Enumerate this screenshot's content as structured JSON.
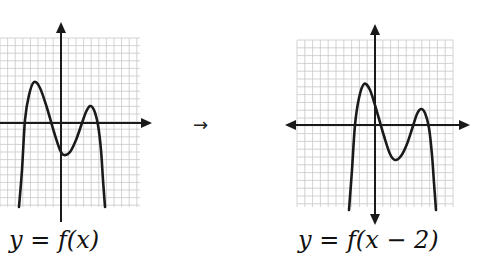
{
  "transform_arrow": "→",
  "graphs": [
    {
      "id": "original",
      "label": "y = f(x)",
      "grid": {
        "x0": 0,
        "x1": 140,
        "y0": 38,
        "y1": 207,
        "cell": 7.6,
        "color": "#c8c8c8"
      },
      "axes": {
        "origin_x": 61,
        "origin_y": 123,
        "x_arrow_end": 152,
        "x_left_end": 0,
        "y_top_end": 22,
        "y_bottom_end": 222,
        "left_arrow": false,
        "bottom_arrow": false
      },
      "curve": [
        [
          19,
          207
        ],
        [
          22,
          170
        ],
        [
          25,
          120
        ],
        [
          29,
          95
        ],
        [
          34,
          82
        ],
        [
          40,
          88
        ],
        [
          47,
          108
        ],
        [
          54,
          132
        ],
        [
          60,
          150
        ],
        [
          64,
          155
        ],
        [
          70,
          152
        ],
        [
          76,
          140
        ],
        [
          82,
          123
        ],
        [
          86,
          112
        ],
        [
          90,
          106
        ],
        [
          94,
          110
        ],
        [
          98,
          125
        ],
        [
          101,
          150
        ],
        [
          103,
          180
        ],
        [
          105,
          207
        ]
      ]
    },
    {
      "id": "shifted",
      "label": "y = f(x − 2)",
      "grid": {
        "x0": 297,
        "x1": 453,
        "y0": 40,
        "y1": 207,
        "cell": 7.8,
        "color": "#c8c8c8"
      },
      "axes": {
        "origin_x": 375,
        "origin_y": 125,
        "x_arrow_end": 470,
        "x_left_end": 285,
        "y_top_end": 24,
        "y_bottom_end": 225,
        "left_arrow": true,
        "bottom_arrow": true
      },
      "curve": [
        [
          349,
          210
        ],
        [
          352,
          170
        ],
        [
          355,
          125
        ],
        [
          359,
          98
        ],
        [
          364,
          84
        ],
        [
          370,
          90
        ],
        [
          377,
          112
        ],
        [
          384,
          136
        ],
        [
          390,
          154
        ],
        [
          395,
          160
        ],
        [
          401,
          156
        ],
        [
          407,
          144
        ],
        [
          413,
          126
        ],
        [
          417,
          114
        ],
        [
          421,
          109
        ],
        [
          425,
          113
        ],
        [
          429,
          128
        ],
        [
          432,
          155
        ],
        [
          434,
          183
        ],
        [
          436,
          210
        ]
      ]
    }
  ],
  "line_color": "#1a1a1a"
}
